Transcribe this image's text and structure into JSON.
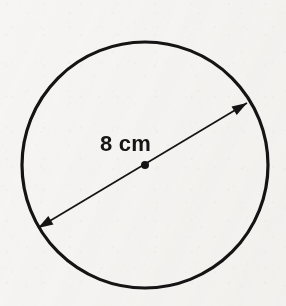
{
  "figure": {
    "background_color": "#f6f5f3",
    "ink_color": "#141414",
    "label": {
      "text": "8 cm",
      "value": 8,
      "unit": "cm",
      "measures": "diameter",
      "x": 100,
      "y": 133,
      "font_size": 22,
      "color": "#151515"
    },
    "circle": {
      "center_x": 145,
      "center_y": 165,
      "radius": 123,
      "stroke_width": 3.2,
      "stroke_color": "#141414",
      "fill": "none"
    },
    "center_dot": {
      "center_x": 145,
      "center_y": 165,
      "radius": 4,
      "color": "#141414"
    },
    "diameter_arrow": {
      "x1": 38,
      "y1": 228,
      "x2": 247,
      "y2": 103,
      "stroke_width": 1.7,
      "stroke_color": "#141414",
      "arrowheads": "both",
      "arrowhead_length": 15,
      "arrowhead_half_width": 5
    }
  }
}
